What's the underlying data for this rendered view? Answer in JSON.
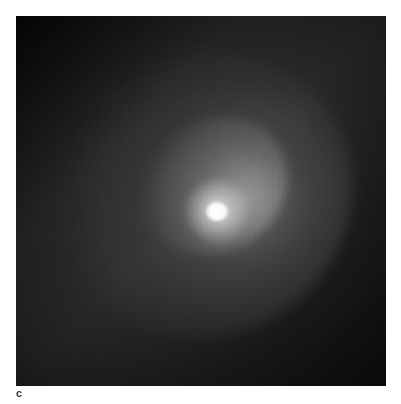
{
  "figure": {
    "panel_label": "c",
    "image_description": "Grayscale astronomical image of a comet: bright compact nucleus with a diffuse coma fanning toward the upper-left on a dark sky background",
    "colors": {
      "background_page": "#ffffff",
      "sky_dark": "#0a0a0a",
      "sky_mid": "#2e2e2e",
      "nucleus": "#ffffff",
      "label_text": "#333333"
    }
  }
}
